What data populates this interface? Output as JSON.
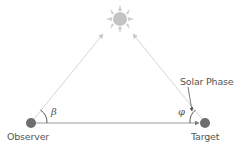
{
  "diagram": {
    "nodes": {
      "sun": {
        "label": "",
        "icon": "sun-icon",
        "color": "#c8c8c8"
      },
      "observer": {
        "label": "Observer",
        "color": "#6e6e6e"
      },
      "target": {
        "label": "Target",
        "color": "#6e6e6e"
      }
    },
    "edges": [
      {
        "from": "observer",
        "to": "sun",
        "style": "arrow",
        "color": "#d2d2d2"
      },
      {
        "from": "target",
        "to": "sun",
        "style": "arrow",
        "color": "#d2d2d2"
      },
      {
        "from": "observer",
        "to": "target",
        "style": "arrow",
        "color": "#9a9a9a"
      }
    ],
    "angles": {
      "beta": {
        "symbol": "β",
        "at": "observer"
      },
      "phi": {
        "symbol": "φ",
        "at": "target"
      }
    },
    "annotation": {
      "label": "Solar Phase",
      "points_to": "phi"
    }
  }
}
